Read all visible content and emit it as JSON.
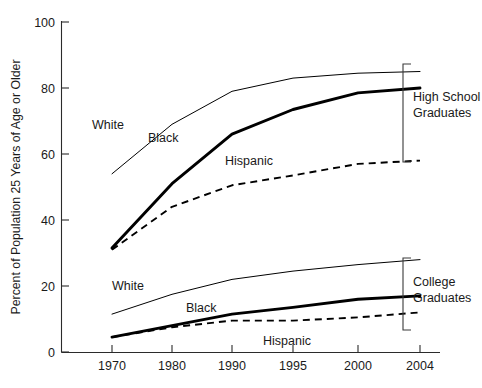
{
  "chart_data": {
    "type": "line",
    "title": "",
    "xlabel": "",
    "ylabel": "Percent of Population 25 Years of Age or Older",
    "categories": [
      "1970",
      "1980",
      "1990",
      "1995",
      "2000",
      "2004"
    ],
    "ylim": [
      0,
      100
    ],
    "yticks": [
      "0",
      "20",
      "40",
      "60",
      "80",
      "100"
    ],
    "grid": false,
    "legend_position": "inline-annotations",
    "groups": [
      {
        "name": "High School Graduates",
        "label": "High School\nGraduates",
        "series": [
          {
            "name": "White",
            "style": "thin-solid",
            "values": [
              54,
              69,
              79,
              83,
              84.5,
              85
            ]
          },
          {
            "name": "Black",
            "style": "thick-solid",
            "values": [
              31.5,
              51,
              66,
              73.5,
              78.5,
              80
            ]
          },
          {
            "name": "Hispanic",
            "style": "dashed",
            "values": [
              31,
              44,
              50.5,
              53.5,
              57,
              58
            ]
          }
        ]
      },
      {
        "name": "College Graduates",
        "label": "College\nGraduates",
        "series": [
          {
            "name": "White",
            "style": "thin-solid",
            "values": [
              11.5,
              17.5,
              22,
              24.5,
              26.5,
              28
            ]
          },
          {
            "name": "Black",
            "style": "thick-solid",
            "values": [
              4.5,
              8,
              11.5,
              13.5,
              16,
              17
            ]
          },
          {
            "name": "Hispanic",
            "style": "dashed",
            "values": [
              4.5,
              7.5,
              9.5,
              9.5,
              10.5,
              12
            ]
          }
        ]
      }
    ],
    "annotations": [
      {
        "text": "White",
        "group": "High School Graduates"
      },
      {
        "text": "Black",
        "group": "High School Graduates"
      },
      {
        "text": "Hispanic",
        "group": "High School Graduates"
      },
      {
        "text": "White",
        "group": "College Graduates"
      },
      {
        "text": "Black",
        "group": "College Graduates"
      },
      {
        "text": "Hispanic",
        "group": "College Graduates"
      }
    ]
  },
  "axis": {
    "y_title": "Percent of Population 25 Years of Age or Older",
    "y_ticks": [
      "100",
      "80",
      "60",
      "40",
      "20",
      "0"
    ],
    "x_ticks": [
      "1970",
      "1980",
      "1990",
      "1995",
      "2000",
      "2004"
    ]
  },
  "labels": {
    "hs_white": "White",
    "hs_black": "Black",
    "hs_hispanic": "Hispanic",
    "col_white": "White",
    "col_black": "Black",
    "col_hispanic": "Hispanic",
    "bracket_hs_line1": "High School",
    "bracket_hs_line2": "Graduates",
    "bracket_col_line1": "College",
    "bracket_col_line2": "Graduates"
  }
}
